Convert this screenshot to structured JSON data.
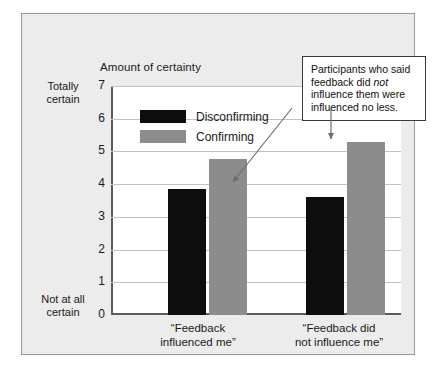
{
  "chart_data": {
    "type": "bar",
    "title": "Amount of certainty",
    "xlabel": "",
    "ylabel": "Amount of certainty",
    "ylim": [
      0,
      7
    ],
    "yticks": [
      0,
      1,
      2,
      3,
      4,
      5,
      6,
      7
    ],
    "grid": true,
    "legend_position": "upper-left-inside",
    "y_axis_top_label": "Totally\ncertain",
    "y_axis_bottom_label": "Not at all\ncertain",
    "categories": [
      "“Feedback\ninfluenced me”",
      "“Feedback did\nnot influence me”"
    ],
    "series": [
      {
        "name": "Disconfirming",
        "color": "#0d0d0d",
        "values": [
          3.85,
          3.6
        ]
      },
      {
        "name": "Confirming",
        "color": "#8c8c8c",
        "values": [
          4.78,
          5.3
        ]
      }
    ],
    "annotations": [
      {
        "text_before": "Participants who said feedback did ",
        "emphasis": "not",
        "text_after": " influence them were influenced no less."
      }
    ]
  },
  "ylabels": {
    "top": "Totally certain",
    "top_line1": "Totally",
    "top_line2": "certain",
    "bottom_line1": "Not at all",
    "bottom_line2": "certain"
  },
  "ticks": {
    "t7": "7",
    "t6": "6",
    "t5": "5",
    "t4": "4",
    "t3": "3",
    "t2": "2",
    "t1": "1",
    "t0": "0"
  },
  "legend": {
    "item1": "Disconfirming",
    "item2": "Confirming"
  },
  "groups": {
    "g1": "“Feedback\ninfluenced me”",
    "g2": "“Feedback did\nnot influence me”"
  },
  "annotation": {
    "part1": "Participants who said feedback did ",
    "emphasis": "not",
    "part2": " influence them were influenced no less."
  },
  "colors": {
    "disconfirming": "#0d0d0d",
    "confirming": "#8c8c8c",
    "panel_background": "#ececec",
    "plot_background": "#ffffff",
    "gridline": "#c2c2c2",
    "axis": "#5c5c5c"
  }
}
